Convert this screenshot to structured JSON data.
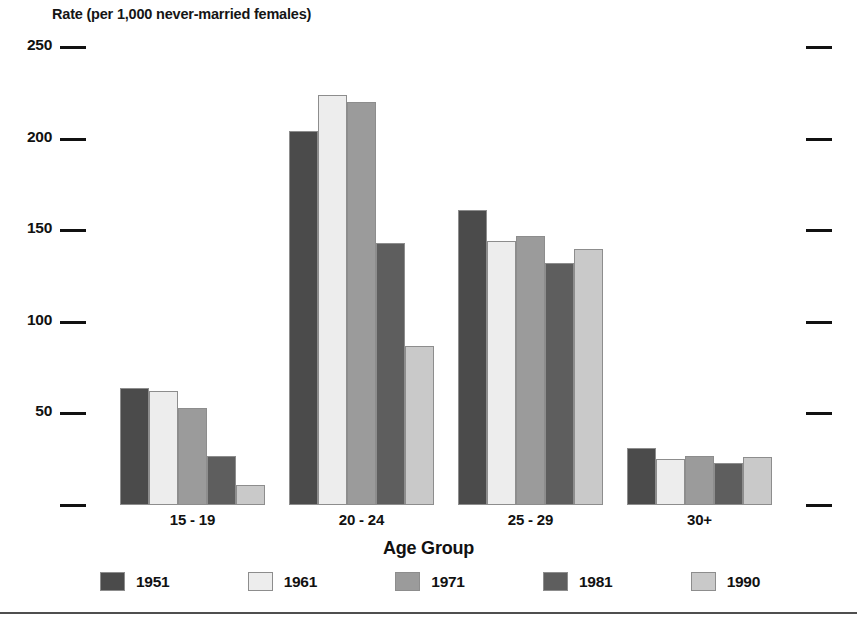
{
  "chart_data": {
    "type": "bar",
    "title": "",
    "ylabel": "Rate (per 1,000 never-married females)",
    "xlabel": "Age Group",
    "categories": [
      "15 - 19",
      "20 - 24",
      "25 - 29",
      "30+"
    ],
    "series": [
      {
        "name": "1951",
        "color": "#4b4b4b",
        "values": [
          64,
          204,
          161,
          31
        ]
      },
      {
        "name": "1961",
        "color": "#ededed",
        "values": [
          62,
          224,
          144,
          25
        ]
      },
      {
        "name": "1971",
        "color": "#9b9b9b",
        "values": [
          53,
          220,
          147,
          27
        ]
      },
      {
        "name": "1981",
        "color": "#5e5e5e",
        "values": [
          27,
          143,
          132,
          23
        ]
      },
      {
        "name": "1990",
        "color": "#c9c9c9",
        "values": [
          11,
          87,
          140,
          26
        ]
      }
    ],
    "ylim": [
      0,
      250
    ],
    "yticks": [
      0,
      50,
      100,
      150,
      200,
      250
    ],
    "ytick_labels": [
      "",
      "50",
      "100",
      "150",
      "200",
      "250"
    ],
    "grid": false,
    "legend_position": "bottom"
  },
  "axis": {
    "y_title": "Rate (per 1,000 never-married females)",
    "x_title": "Age Group"
  }
}
